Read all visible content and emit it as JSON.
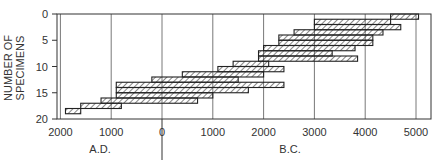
{
  "chart_data": {
    "type": "bar",
    "subtype": "stepped-range-band",
    "title": "",
    "ylabel": "NUMBER OF SPECIMENS",
    "xlabel_left": "A.D.",
    "xlabel_right": "B.C.",
    "ylim": [
      0,
      20
    ],
    "y_ticks": [
      "0",
      "5",
      "10",
      "15",
      "20"
    ],
    "x_ticks": [
      {
        "value": -2000,
        "label": "2000"
      },
      {
        "value": -1000,
        "label": "1000"
      },
      {
        "value": 0,
        "label": "0"
      },
      {
        "value": 1000,
        "label": "1000"
      },
      {
        "value": 2000,
        "label": "2000"
      },
      {
        "value": 3000,
        "label": "3000"
      },
      {
        "value": 4000,
        "label": "4000"
      },
      {
        "value": 5000,
        "label": "5000"
      }
    ],
    "x_note": "negative values = A.D., positive values = B.C.",
    "grid": true,
    "ranges": [
      {
        "from": 4500,
        "to": 5050,
        "y0": 0,
        "y1": 1
      },
      {
        "from": 3000,
        "to": 4500,
        "y0": 1,
        "y1": 2
      },
      {
        "from": 3000,
        "to": 4700,
        "y0": 2,
        "y1": 3
      },
      {
        "from": 2600,
        "to": 4350,
        "y0": 3,
        "y1": 4
      },
      {
        "from": 2300,
        "to": 4150,
        "y0": 4,
        "y1": 5
      },
      {
        "from": 2300,
        "to": 4150,
        "y0": 5,
        "y1": 6
      },
      {
        "from": 2000,
        "to": 3800,
        "y0": 6,
        "y1": 7
      },
      {
        "from": 1900,
        "to": 3350,
        "y0": 7,
        "y1": 8
      },
      {
        "from": 1900,
        "to": 3850,
        "y0": 8,
        "y1": 9
      },
      {
        "from": 1400,
        "to": 2100,
        "y0": 9,
        "y1": 10
      },
      {
        "from": 1100,
        "to": 2400,
        "y0": 10,
        "y1": 11
      },
      {
        "from": 400,
        "to": 2000,
        "y0": 11,
        "y1": 12
      },
      {
        "from": -200,
        "to": 1500,
        "y0": 12,
        "y1": 13
      },
      {
        "from": -900,
        "to": 2400,
        "y0": 13,
        "y1": 14
      },
      {
        "from": -900,
        "to": 1700,
        "y0": 14,
        "y1": 15
      },
      {
        "from": -900,
        "to": 1000,
        "y0": 15,
        "y1": 16
      },
      {
        "from": -1200,
        "to": 700,
        "y0": 16,
        "y1": 17
      },
      {
        "from": -1600,
        "to": -800,
        "y0": 17,
        "y1": 18
      },
      {
        "from": -1900,
        "to": -1600,
        "y0": 18,
        "y1": 19
      }
    ]
  }
}
